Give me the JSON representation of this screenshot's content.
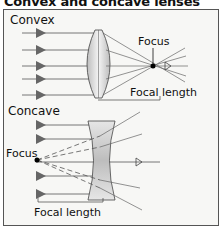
{
  "title": "Convex and concave lenses",
  "convex": {
    "label": "Convex",
    "focus_label": "Focus",
    "focal_length_label": "Focal length"
  },
  "concave": {
    "label": "Concave",
    "focus_label": "Focus",
    "focal_length_label": "Focal length"
  },
  "colors": {
    "ray": "#555555",
    "arrow": "#666666",
    "lens": "#cfcfcf",
    "frame": "#555555"
  }
}
